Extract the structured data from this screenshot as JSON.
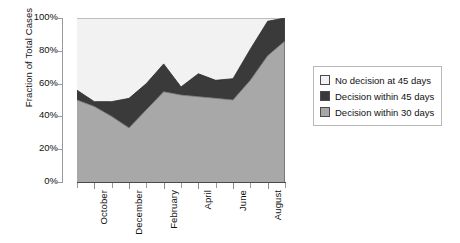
{
  "chart_data": {
    "type": "area",
    "stacked": true,
    "title": "",
    "xlabel": "",
    "ylabel": "Fraction of Total Cases",
    "ylim": [
      0,
      100
    ],
    "ytick_labels": [
      "0%",
      "20%",
      "40%",
      "60%",
      "80%",
      "100%"
    ],
    "ytick_values": [
      0,
      20,
      40,
      60,
      80,
      100
    ],
    "grid": false,
    "legend_position": "right",
    "x": [
      "September",
      "October",
      "November",
      "December",
      "January",
      "February",
      "March",
      "April",
      "May",
      "June",
      "July",
      "August",
      "September"
    ],
    "xtick_labels": [
      "October",
      "December",
      "February",
      "April",
      "June",
      "August"
    ],
    "xtick_label_indices": [
      1,
      3,
      5,
      7,
      9,
      11
    ],
    "series": [
      {
        "name": "Decision within 30 days",
        "color": "#a8a8a8",
        "values": [
          50,
          46,
          40,
          33,
          44,
          55,
          53,
          52,
          51,
          50,
          62,
          77,
          86
        ]
      },
      {
        "name": "Decision within 45 days",
        "color": "#3a3a3a",
        "values": [
          6,
          3,
          9,
          18,
          16,
          17,
          5,
          14,
          11,
          13,
          19,
          21,
          14
        ]
      },
      {
        "name": "No decision at 45 days",
        "color": "#f2f2f2",
        "values": [
          44,
          51,
          51,
          49,
          40,
          28,
          42,
          34,
          38,
          37,
          19,
          2,
          0
        ]
      }
    ],
    "cumulative_upper_30": [
      50,
      46,
      40,
      33,
      44,
      55,
      53,
      52,
      51,
      50,
      62,
      77,
      86
    ],
    "cumulative_upper_45": [
      56,
      49,
      49,
      51,
      60,
      72,
      58,
      66,
      62,
      63,
      81,
      98,
      100
    ],
    "axis_colors": {
      "spine": "#9a9a9a",
      "baseline": "#4a4a4a",
      "text": "#111111",
      "background": "#ffffff"
    }
  },
  "legend": {
    "items": [
      {
        "label": "No decision at 45 days",
        "color": "#f2f2f2"
      },
      {
        "label": "Decision within 45 days",
        "color": "#3a3a3a"
      },
      {
        "label": "Decision within 30 days",
        "color": "#a8a8a8"
      }
    ]
  }
}
